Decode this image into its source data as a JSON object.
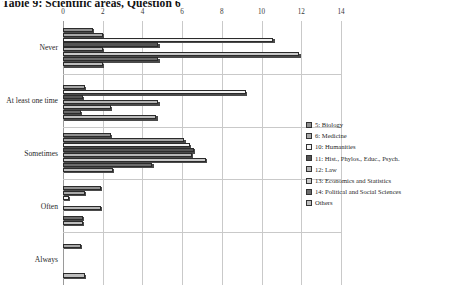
{
  "caption": "Table 9:  Scientific areas, Question 6",
  "chart_data": {
    "type": "bar",
    "orientation": "horizontal",
    "title": "Table 9:  Scientific areas, Question 6",
    "xlabel": "",
    "ylabel": "",
    "xlim": [
      0,
      14
    ],
    "xticks": [
      0,
      2,
      4,
      6,
      8,
      10,
      12,
      14
    ],
    "grid": true,
    "legend_position": "right",
    "categories": [
      "Never",
      "At least one time",
      "Sometimes",
      "Often",
      "Always"
    ],
    "series": [
      {
        "name": "5: Biology",
        "color": "#8f8f8f",
        "values": [
          1.5,
          0.0,
          2.4,
          1.9,
          0.0
        ]
      },
      {
        "name": "6: Medicine",
        "color": "#a8a8a8",
        "values": [
          2.0,
          1.1,
          6.1,
          1.1,
          0.9
        ]
      },
      {
        "name": "10: Humanities",
        "color": "#f2f2f2",
        "values": [
          10.6,
          9.2,
          6.4,
          0.3,
          0.0
        ]
      },
      {
        "name": "11: Hist., Phylos., Educ., Psych.",
        "color": "#545454",
        "values": [
          4.8,
          1.0,
          6.6,
          0.0,
          0.0
        ]
      },
      {
        "name": "12: Law",
        "color": "#b5b5b5",
        "values": [
          2.0,
          4.8,
          6.5,
          1.9,
          0.0
        ]
      },
      {
        "name": "13: Economics and Statistics",
        "color": "#c9c9c9",
        "values": [
          11.9,
          2.4,
          7.2,
          0.0,
          0.0
        ]
      },
      {
        "name": "14: Political and Social Sciences",
        "color": "#6b6b6b",
        "values": [
          4.8,
          0.9,
          4.5,
          1.0,
          0.0
        ]
      },
      {
        "name": "Others",
        "color": "#bdbdbd",
        "values": [
          2.0,
          4.7,
          2.5,
          1.0,
          1.1
        ]
      }
    ]
  },
  "legend": {
    "items": [
      {
        "label": "5: Biology"
      },
      {
        "label": "6: Medicine"
      },
      {
        "label": "10: Humanities"
      },
      {
        "label": "11: Hist., Phylos., Educ., Psych."
      },
      {
        "label": "12: Law"
      },
      {
        "label": "13: Economics and Statistics"
      },
      {
        "label": "14: Political and Social Sciences"
      },
      {
        "label": "Others"
      }
    ]
  }
}
